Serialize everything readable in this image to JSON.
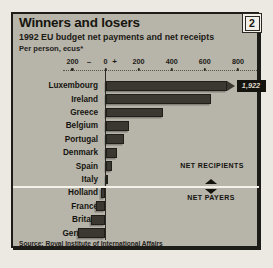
{
  "figure_badge": "2",
  "header": {
    "title": "Winners and losers",
    "subtitle": "1992 EU budget net payments and net receipts",
    "unit_note": "Per person, ecus*"
  },
  "annotations": {
    "recipients": "NET RECIPIENTS",
    "payers": "NET PAYERS"
  },
  "source": "Source: Royal Institute of International Affairs",
  "colors": {
    "panel_bg": "#b7b4aa",
    "bar": "#3a3831",
    "page_bg": "#ebe9e1",
    "callout_bg": "#14130e",
    "divider_line": "#f3f1ea",
    "text": "#16150f"
  },
  "chart_data": {
    "type": "bar",
    "orientation": "horizontal",
    "title": "Winners and losers",
    "subtitle": "1992 EU budget net payments and net receipts",
    "xlabel": "ecus per person",
    "xlim": [
      -260,
      950
    ],
    "axis_ticks": [
      {
        "label": "200",
        "value": -200,
        "dot": true,
        "sign": false
      },
      {
        "label": "–",
        "value": -100,
        "dot": false,
        "sign": true
      },
      {
        "label": "0",
        "value": 0,
        "dot": true,
        "sign": false
      },
      {
        "label": "+",
        "value": 55,
        "dot": false,
        "sign": true
      },
      {
        "label": "200",
        "value": 200,
        "dot": true,
        "sign": false
      },
      {
        "label": "400",
        "value": 400,
        "dot": true,
        "sign": false
      },
      {
        "label": "600",
        "value": 600,
        "dot": true,
        "sign": false
      },
      {
        "label": "800",
        "value": 800,
        "dot": true,
        "sign": false
      }
    ],
    "categories": [
      "Luxembourg",
      "Ireland",
      "Greece",
      "Belgium",
      "Portugal",
      "Denmark",
      "Spain",
      "Italy",
      "Holland",
      "France",
      "Britain",
      "Germany"
    ],
    "values": [
      1922,
      640,
      350,
      140,
      110,
      70,
      40,
      10,
      -25,
      -55,
      -85,
      -165
    ],
    "offscale_categories": [
      "Luxembourg"
    ],
    "value_labels": {
      "Luxembourg": "1,922"
    },
    "groups": {
      "net_recipients": [
        "Luxembourg",
        "Ireland",
        "Greece",
        "Belgium",
        "Portugal",
        "Denmark",
        "Spain",
        "Italy"
      ],
      "net_payers": [
        "Holland",
        "France",
        "Britain",
        "Germany"
      ]
    },
    "legend": "none",
    "grid": "dotted top axis only",
    "source": "Source: Royal Institute of International Affairs"
  }
}
